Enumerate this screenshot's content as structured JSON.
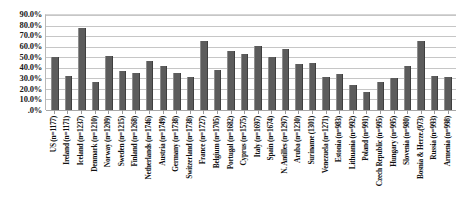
{
  "chart_data": {
    "type": "bar",
    "title": "",
    "xlabel": "",
    "ylabel": "",
    "ylim": [
      0,
      90
    ],
    "grid": true,
    "legend": null,
    "ytick_labels": [
      "90.0%",
      "80.0%",
      "70.0%",
      "60.0%",
      "50.0%",
      "40.0%",
      "30.0%",
      "20.0%",
      "10.0%",
      ".0%"
    ],
    "ytick_values": [
      90,
      80,
      70,
      60,
      50,
      40,
      30,
      20,
      10,
      0
    ],
    "categories": [
      "US (n=1177)",
      "Ireland (n=1171)",
      "Iceland (n=1237)",
      "Denmark (n=1210)",
      "Norway (n=1209)",
      "Sweden (n=1215)",
      "Finland (n=1268)",
      "Netherlands (n=1746)",
      "Austria (n=1749)",
      "Germany (n=1738)",
      "Switzerland (n=1738)",
      "France (n=1727)",
      "Belgium (n=1705)",
      "Portugal (n=1682)",
      "Cyprus (n=1575)",
      "Italy (n=1697)",
      "Spain (n=1674)",
      "N. Antilles (n=1297)",
      "Aruba (n=1230)",
      "Suriname (1301)",
      "Venezuela (n=1271)",
      "Estonia (n=983)",
      "Lithuania (n=992)",
      "Poland (n=991)",
      "Czech Republic (n=995)",
      "Hungary (n=995)",
      "Slovenia (n=980)",
      "Bosnia & Herze.(973)",
      "Russia (n=993)",
      "Armenia (n=998)"
    ],
    "values": [
      50.0,
      32.0,
      78.0,
      27.0,
      51.0,
      37.0,
      35.0,
      46.0,
      42.0,
      35.0,
      31.0,
      65.0,
      38.0,
      56.0,
      53.0,
      61.0,
      50.0,
      58.0,
      44.0,
      45.0,
      31.0,
      34.0,
      24.0,
      17.0,
      27.0,
      30.0,
      42.0,
      65.0,
      32.0,
      31.0
    ]
  }
}
